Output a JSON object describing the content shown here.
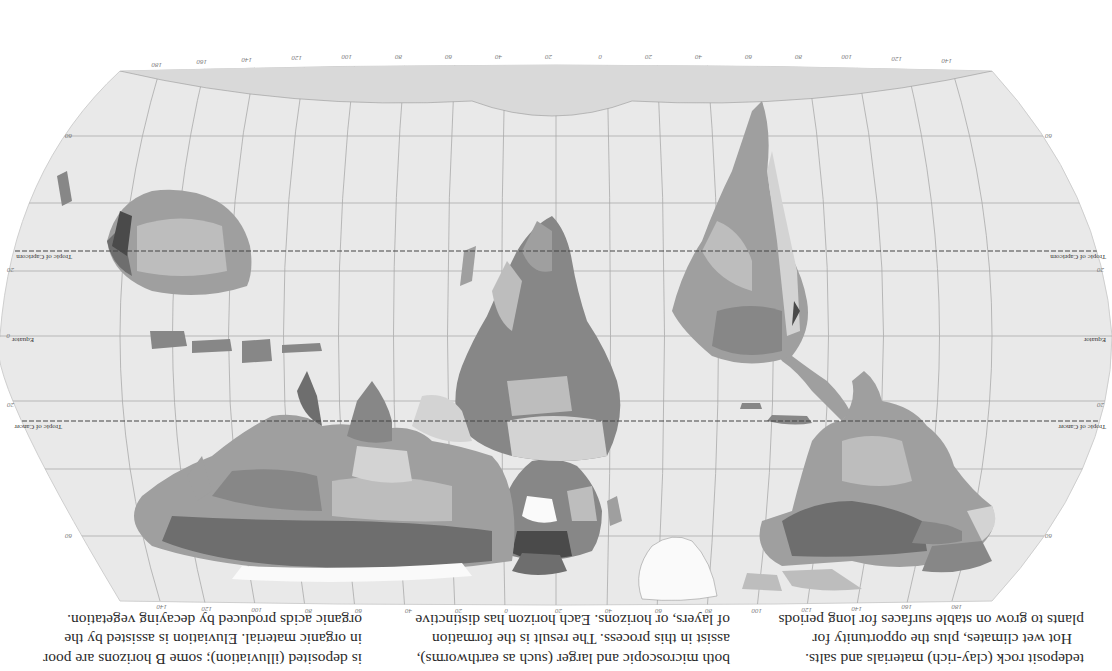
{
  "page": {
    "orientation": "rotated-180",
    "background": "#ffffff"
  },
  "map": {
    "title": "World soil map",
    "ocean_color": "#e9e9e9",
    "land_colors": {
      "very_light": "#d3d3d3",
      "light": "#bdbdbd",
      "medium": "#9f9f9f",
      "dark": "#878787",
      "darker": "#6e6e6e",
      "darkest": "#4a4a4a",
      "ice": "#fafafa"
    },
    "lines": {
      "tropic_of_cancer": "Tropic of Cancer",
      "tropic_of_capricorn": "Tropic of Capricorn",
      "equator": "Equator"
    },
    "latitude_ticks": [
      "60",
      "40",
      "20",
      "0",
      "20",
      "40",
      "60"
    ],
    "longitude_ticks_top": [
      "180",
      "160",
      "140",
      "120",
      "100",
      "80",
      "60",
      "40",
      "20",
      "0",
      "20",
      "40",
      "60",
      "80",
      "100",
      "120",
      "140",
      "160",
      "180"
    ],
    "longitude_ticks_bottom": [
      "180",
      "160",
      "140",
      "120",
      "100",
      "80",
      "60",
      "40",
      "20",
      "0",
      "20",
      "40",
      "60",
      "80",
      "100",
      "120",
      "140",
      "160",
      "180"
    ]
  },
  "text": {
    "column_left": [
      "tedeposit rock (clay-rich) materials and salts.",
      "Hot wet climates, plus the opportunity for",
      "plants to grow on stable surfaces for long periods"
    ],
    "column_middle": [
      "both microscopic and larger (such as earthworms),",
      "assist in this process. The result is the formation",
      "of layers, or horizons. Each horizon has distinctive"
    ],
    "column_right": [
      "is deposited (illuviation); some B horizons are poor",
      "in organic material. Eluviation is assisted by the",
      "organic acids produced by decaying vegetation."
    ]
  }
}
